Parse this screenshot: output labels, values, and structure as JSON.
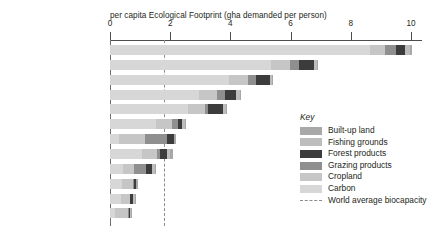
{
  "chart_data": {
    "type": "bar",
    "orientation": "horizontal",
    "stacked": true,
    "title": "per capita Ecological Footprint (gha demanded per person)",
    "xlabel": "per capita Ecological Footprint (gha demanded per person)",
    "ylabel": "",
    "xlim": [
      0,
      10.4
    ],
    "xticks": [
      0,
      2,
      4,
      6,
      8,
      10
    ],
    "xtick_labels": [
      "0",
      "2",
      "4",
      "6",
      "8",
      "10"
    ],
    "grid": false,
    "legend_position": "inside-right",
    "categories": [
      "Kuwait",
      "United States of America",
      "Canada",
      "United Kingdom",
      "Russia",
      "world average",
      "Niger",
      "China",
      "Peru",
      "India",
      "Bangladesh",
      "Afghanistan"
    ],
    "series": [
      {
        "name": "Carbon",
        "color": "#d7d7d7",
        "values": [
          8.65,
          5.35,
          3.95,
          2.95,
          2.6,
          1.52,
          0.3,
          1.05,
          0.42,
          0.4,
          0.37,
          0.18
        ]
      },
      {
        "name": "Cropland",
        "color": "#c6c6c6",
        "values": [
          0.48,
          0.62,
          0.62,
          0.62,
          0.55,
          0.55,
          0.85,
          0.52,
          0.38,
          0.35,
          0.28,
          0.42
        ]
      },
      {
        "name": "Grazing products",
        "color": "#8f8f8f",
        "values": [
          0.38,
          0.3,
          0.28,
          0.25,
          0.12,
          0.18,
          0.75,
          0.1,
          0.4,
          0.04,
          0.03,
          0.03
        ]
      },
      {
        "name": "Forest products",
        "color": "#3c3c3c",
        "values": [
          0.28,
          0.52,
          0.48,
          0.38,
          0.5,
          0.15,
          0.22,
          0.22,
          0.2,
          0.06,
          0.07,
          0.05
        ]
      },
      {
        "name": "Fishing grounds",
        "color": "#bdbdbd",
        "values": [
          0.18,
          0.08,
          0.06,
          0.11,
          0.08,
          0.08,
          0.02,
          0.11,
          0.08,
          0.02,
          0.07,
          0.01
        ]
      },
      {
        "name": "Built-up land",
        "color": "#a8a8a8",
        "values": [
          0.08,
          0.04,
          0.04,
          0.06,
          0.05,
          0.05,
          0.06,
          0.1,
          0.05,
          0.05,
          0.06,
          0.03
        ]
      }
    ],
    "totals": [
      10.05,
      6.91,
      5.43,
      4.37,
      3.9,
      2.53,
      2.2,
      2.1,
      1.53,
      0.92,
      0.88,
      0.72
    ],
    "reference_line": {
      "label": "World average biocapacity",
      "value": 1.78,
      "style": "dashed",
      "color": "#8c8c8c"
    },
    "highlighted_category": "world average"
  },
  "legend": {
    "title": "Key",
    "items": [
      {
        "label": "Built-up land",
        "color": "#a8a8a8",
        "type": "swatch"
      },
      {
        "label": "Fishing grounds",
        "color": "#bdbdbd",
        "type": "swatch"
      },
      {
        "label": "Forest products",
        "color": "#3c3c3c",
        "type": "swatch"
      },
      {
        "label": "Grazing products",
        "color": "#8f8f8f",
        "type": "swatch"
      },
      {
        "label": "Cropland",
        "color": "#c6c6c6",
        "type": "swatch"
      },
      {
        "label": "Carbon",
        "color": "#d7d7d7",
        "type": "swatch"
      },
      {
        "label": "World average biocapacity",
        "color": "#8c8c8c",
        "type": "dash"
      }
    ]
  },
  "colors": {
    "axis": "#4d4d4d",
    "text": "#231f20",
    "muted_text": "#9a9a9a",
    "background": "#ffffff"
  }
}
